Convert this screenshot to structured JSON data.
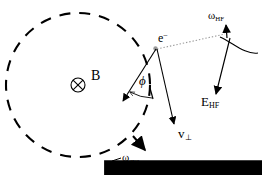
{
  "figure": {
    "background_color": "#ffffff",
    "stroke_color": "#000000",
    "width": 262,
    "height": 175
  },
  "labels": {
    "electron": {
      "text": "e",
      "superscript": "−",
      "name": "electron"
    },
    "magnetic_field": {
      "text": "B",
      "vector": true,
      "name": "magnetic-field-vector"
    },
    "angle_phi": {
      "text": "ϕ",
      "name": "phase-angle-phi"
    },
    "velocity_perp": {
      "text": "v",
      "subscript": "⊥",
      "vector": true,
      "name": "perpendicular-velocity-vector"
    },
    "omega_hf": {
      "text": "ω",
      "subscript": "HF",
      "name": "high-frequency-angular-frequency"
    },
    "e_field_hf": {
      "text": "E",
      "subscript": "HF",
      "vector": true,
      "name": "high-frequency-electric-field-vector"
    },
    "omega_cyc": {
      "text": "ω",
      "subscript": "cyc",
      "name": "cyclotron-angular-frequency"
    }
  },
  "elements": {
    "cyclotron_orbit": {
      "kind": "dashed-circle",
      "center_x": 78,
      "center_y": 85,
      "radius": 72
    },
    "field_into_page_symbol": {
      "kind": "circle-with-cross",
      "center_x": 78,
      "center_y": 85,
      "radius": 7
    },
    "electron_marker": {
      "kind": "point",
      "x": 155,
      "y": 48
    },
    "hf_field_axis": {
      "kind": "solid-line-with-arrow",
      "x1": 227,
      "y1": 24,
      "x2": 218,
      "y2": 96
    },
    "hf_rotation_arc": {
      "kind": "curved-arc",
      "description": "rotation arc crossing the HF field axis"
    },
    "dotted_connector": {
      "kind": "dotted-line",
      "x1": 157,
      "y1": 49,
      "x2": 226,
      "y2": 34
    }
  }
}
